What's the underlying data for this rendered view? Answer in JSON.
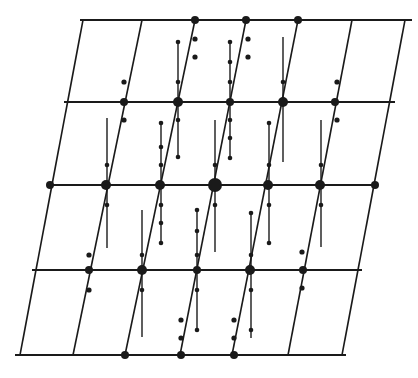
{
  "diagram": {
    "title": "",
    "colors": {
      "ink": "#1a1a1a",
      "background": "#ffffff"
    },
    "rows": [
      {
        "y": 20,
        "x1": 80,
        "x2": 412
      },
      {
        "y": 102,
        "x1": 64,
        "x2": 395
      },
      {
        "y": 185,
        "x1": 48,
        "x2": 378
      },
      {
        "y": 270,
        "x1": 32,
        "x2": 362
      },
      {
        "y": 355,
        "x1": 15,
        "x2": 346
      }
    ],
    "slant_lines": [
      {
        "x_top": 83,
        "x_bot": 20
      },
      {
        "x_top": 142,
        "x_bot": 73
      },
      {
        "x_top": 195,
        "x_bot": 125
      },
      {
        "x_top": 246,
        "x_bot": 180
      },
      {
        "x_top": 298,
        "x_bot": 232
      },
      {
        "x_top": 352,
        "x_bot": 288
      },
      {
        "x_top": 405,
        "x_bot": 342
      }
    ],
    "nodes": [
      {
        "x": 195,
        "y": 20,
        "r": 4
      },
      {
        "x": 246,
        "y": 20,
        "r": 4
      },
      {
        "x": 298,
        "y": 20,
        "r": 4
      },
      {
        "x": 124,
        "y": 102,
        "r": 4
      },
      {
        "x": 178,
        "y": 102,
        "r": 5
      },
      {
        "x": 230,
        "y": 102,
        "r": 4
      },
      {
        "x": 283,
        "y": 102,
        "r": 5
      },
      {
        "x": 335,
        "y": 102,
        "r": 4
      },
      {
        "x": 50,
        "y": 185,
        "r": 4
      },
      {
        "x": 106,
        "y": 185,
        "r": 5
      },
      {
        "x": 160,
        "y": 185,
        "r": 5
      },
      {
        "x": 215,
        "y": 185,
        "r": 7
      },
      {
        "x": 268,
        "y": 185,
        "r": 5
      },
      {
        "x": 320,
        "y": 185,
        "r": 5
      },
      {
        "x": 375,
        "y": 185,
        "r": 4
      },
      {
        "x": 89,
        "y": 270,
        "r": 4
      },
      {
        "x": 142,
        "y": 270,
        "r": 5
      },
      {
        "x": 197,
        "y": 270,
        "r": 4
      },
      {
        "x": 250,
        "y": 270,
        "r": 5
      },
      {
        "x": 303,
        "y": 270,
        "r": 4
      },
      {
        "x": 125,
        "y": 355,
        "r": 4
      },
      {
        "x": 181,
        "y": 355,
        "r": 4
      },
      {
        "x": 234,
        "y": 355,
        "r": 4
      }
    ],
    "satellites": [
      {
        "x": 124,
        "y": 82
      },
      {
        "x": 124,
        "y": 120
      },
      {
        "x": 195,
        "y": 39
      },
      {
        "x": 195,
        "y": 57
      },
      {
        "x": 248,
        "y": 39
      },
      {
        "x": 248,
        "y": 57
      },
      {
        "x": 337,
        "y": 82
      },
      {
        "x": 337,
        "y": 120
      },
      {
        "x": 89,
        "y": 255
      },
      {
        "x": 89,
        "y": 290
      },
      {
        "x": 302,
        "y": 252
      },
      {
        "x": 302,
        "y": 288
      },
      {
        "x": 181,
        "y": 320
      },
      {
        "x": 181,
        "y": 338
      },
      {
        "x": 234,
        "y": 320
      },
      {
        "x": 234,
        "y": 338
      }
    ],
    "streaks": [
      {
        "x": 178,
        "y1": 42,
        "y2": 157,
        "ticks": [
          42,
          82,
          102,
          120,
          157
        ]
      },
      {
        "x": 230,
        "y1": 42,
        "y2": 158,
        "ticks": [
          42,
          62,
          82,
          120,
          138,
          158
        ]
      },
      {
        "x": 283,
        "y1": 37,
        "y2": 162,
        "ticks": [
          82
        ]
      },
      {
        "x": 107,
        "y1": 118,
        "y2": 248,
        "ticks": [
          165,
          205
        ]
      },
      {
        "x": 161,
        "y1": 123,
        "y2": 243,
        "ticks": [
          123,
          147,
          165,
          205,
          223,
          243
        ]
      },
      {
        "x": 215,
        "y1": 120,
        "y2": 252,
        "ticks": [
          165,
          205
        ]
      },
      {
        "x": 269,
        "y1": 123,
        "y2": 243,
        "ticks": [
          123,
          165,
          205,
          243
        ]
      },
      {
        "x": 321,
        "y1": 120,
        "y2": 247,
        "ticks": [
          165,
          205
        ]
      },
      {
        "x": 142,
        "y1": 210,
        "y2": 337,
        "ticks": [
          255,
          290
        ]
      },
      {
        "x": 197,
        "y1": 210,
        "y2": 330,
        "ticks": [
          210,
          231,
          255,
          290,
          330
        ]
      },
      {
        "x": 251,
        "y1": 213,
        "y2": 338,
        "ticks": [
          213,
          255,
          290,
          330
        ]
      }
    ]
  }
}
